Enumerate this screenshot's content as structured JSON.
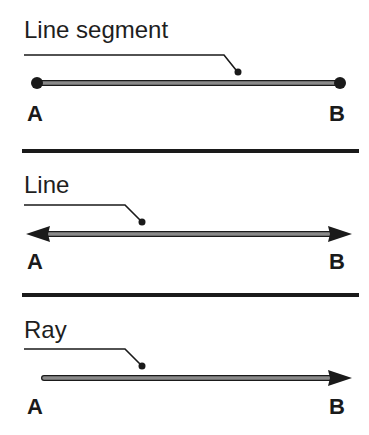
{
  "diagram": {
    "colors": {
      "ink": "#1a1a1a",
      "line_fill": "#8a8a8a"
    },
    "sections": [
      {
        "id": "line-segment",
        "title": "Line segment",
        "start_label": "A",
        "end_label": "B",
        "start_marker": "dot",
        "end_marker": "dot"
      },
      {
        "id": "line",
        "title": "Line",
        "start_label": "A",
        "end_label": "B",
        "start_marker": "arrow",
        "end_marker": "arrow"
      },
      {
        "id": "ray",
        "title": "Ray",
        "start_label": "A",
        "end_label": "B",
        "start_marker": "none",
        "end_marker": "arrow"
      }
    ]
  }
}
